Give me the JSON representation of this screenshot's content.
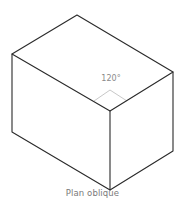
{
  "diagram": {
    "type": "isometric-box",
    "angle_label": "120°",
    "caption": "Plan oblique",
    "colors": {
      "edges": "#2a2a2a",
      "angle_marker": "#c8c8c8",
      "angle_text": "#8a8a8a",
      "caption_text": "#7a7a7a"
    },
    "vertices": {
      "top": [
        77,
        15
      ],
      "left_top": [
        12,
        54
      ],
      "front_top": [
        110,
        111
      ],
      "right_top": [
        173,
        72
      ],
      "left_bottom": [
        12,
        132
      ],
      "front_bottom": [
        110,
        190
      ],
      "right_bottom": [
        173,
        151
      ]
    }
  }
}
